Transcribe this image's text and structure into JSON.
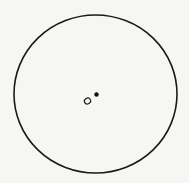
{
  "diagram": {
    "type": "geometry",
    "background": "#f6f6f4",
    "stroke_color": "#1a1a1a",
    "circle": {
      "cx": 95.5,
      "cy": 94,
      "rx": 81.5,
      "ry": 79,
      "stroke_width": 1.6
    },
    "points": [
      {
        "id": "hollow-point",
        "style": "hollow",
        "cx": 87.5,
        "cy": 101,
        "rx": 3.2,
        "ry": 2.8,
        "label": ""
      },
      {
        "id": "filled-point",
        "style": "filled",
        "cx": 96.5,
        "cy": 94.5,
        "r": 2.2,
        "label": ""
      }
    ]
  }
}
